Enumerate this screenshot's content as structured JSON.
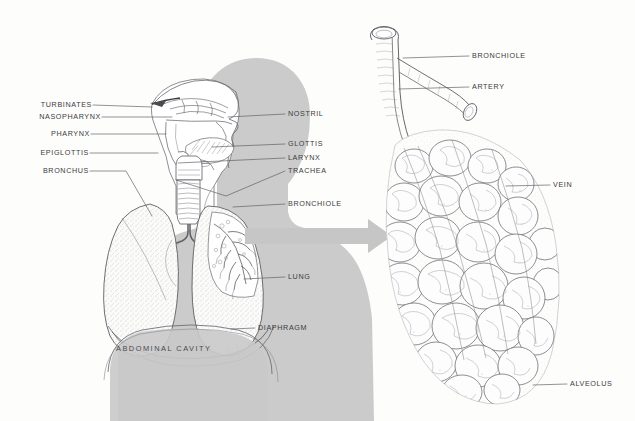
{
  "figure": {
    "background_color": "#fdfdfc",
    "silhouette_color": "#c8c8c8",
    "ink_color": "#4a4a50",
    "label_color": "#3b3b40",
    "arrow_color": "#c6c6c6"
  },
  "left_panel": {
    "name": "human-torso-respiratory-overview",
    "cavity_label": "ABDOMINAL CAVITY",
    "labels_left": [
      {
        "text": "TURBINATES",
        "x": 38,
        "y": 104,
        "leader_to_x": 152,
        "leader_to_y": 107
      },
      {
        "text": "NASOPHARYNX",
        "x": 28,
        "y": 116,
        "leader_to_x": 172,
        "leader_to_y": 117
      },
      {
        "text": "PHARYNX",
        "x": 50,
        "y": 133,
        "leader_to_x": 166,
        "leader_to_y": 134
      },
      {
        "text": "EPIGLOTTIS",
        "x": 42,
        "y": 151,
        "leader_to_x": 158,
        "leader_to_y": 153
      },
      {
        "text": "BRONCHUS",
        "x": 42,
        "y": 170,
        "leader_to_x": 152,
        "leader_to_y": 216
      }
    ],
    "labels_right": [
      {
        "text": "NOSTRIL",
        "x": 288,
        "y": 113,
        "leader_to_x": 228,
        "leader_to_y": 117
      },
      {
        "text": "GLOTTIS",
        "x": 288,
        "y": 143,
        "leader_to_x": 212,
        "leader_to_y": 147
      },
      {
        "text": "LARYNX",
        "x": 288,
        "y": 157,
        "leader_to_x": 178,
        "leader_to_y": 163
      },
      {
        "text": "TRACHEA",
        "x": 288,
        "y": 170,
        "leader_to_x": 176,
        "leader_to_y": 180
      },
      {
        "text": "BRONCHIOLE",
        "x": 288,
        "y": 203,
        "leader_to_x": 233,
        "leader_to_y": 207
      },
      {
        "text": "LUNG",
        "x": 288,
        "y": 276,
        "leader_to_x": 244,
        "leader_to_y": 279
      },
      {
        "text": "DIAPHRAGM",
        "x": 258,
        "y": 327,
        "leader_to_x": 231,
        "leader_to_y": 329
      }
    ]
  },
  "right_panel": {
    "name": "alveolar-cluster-detail",
    "labels": [
      {
        "text": "BRONCHIOLE",
        "x": 472,
        "y": 55,
        "leader_to_x": 403,
        "leader_to_y": 58
      },
      {
        "text": "ARTERY",
        "x": 472,
        "y": 86,
        "leader_to_x": 399,
        "leader_to_y": 89
      },
      {
        "text": "VEIN",
        "x": 553,
        "y": 184,
        "leader_to_x": 506,
        "leader_to_y": 186
      },
      {
        "text": "ALVEOLUS",
        "x": 570,
        "y": 383,
        "leader_to_x": 533,
        "leader_to_y": 385
      }
    ]
  },
  "arrow": {
    "name": "transition-arrow",
    "from_x": 245,
    "to_x": 392,
    "y": 236
  }
}
